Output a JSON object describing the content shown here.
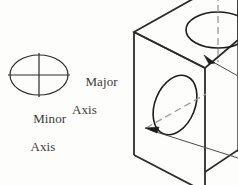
{
  "figure": {
    "background_color": "#fdfdfc",
    "line_color": "#2b2b2b",
    "centerline_color": "#8c8c8c",
    "text_color": "#3a3a3a"
  },
  "legend": {
    "ellipse": {
      "center_x": 39,
      "center_y": 75,
      "rx": 29,
      "ry": 20,
      "major_axis_label": "Major",
      "major_axis_label_line2": "Axis",
      "minor_axis_label": "Minor",
      "minor_axis_label_line2": "Axis"
    }
  },
  "labels": {
    "major": {
      "line1": "Major",
      "line2": "Axis"
    },
    "minor": {
      "line1": "Minor",
      "line2": "Axis"
    }
  },
  "solid": {
    "type": "isometric-box",
    "faces": [
      "top",
      "front-left",
      "right"
    ],
    "holes": [
      {
        "name": "top-face-hole",
        "shape": "ellipse",
        "center_x": 218,
        "center_y": 30,
        "rx": 32,
        "ry": 18,
        "rotation_deg": 0,
        "centerline": "vertical-dashed"
      },
      {
        "name": "front-face-hole",
        "shape": "ellipse",
        "center_x": 175,
        "center_y": 105,
        "rx": 20,
        "ry": 31,
        "rotation_deg": 22,
        "centerline": "diagonal-dashed"
      }
    ],
    "leaders": [
      {
        "name": "top-hole-leader",
        "arrow_x": 206,
        "arrow_y": 57,
        "direction": "up-left"
      },
      {
        "name": "front-hole-leader",
        "arrow_x": 147,
        "arrow_y": 129,
        "direction": "left"
      }
    ]
  },
  "geometry": {
    "box_vertices": {
      "top_left": [
        134,
        32
      ],
      "top_back": [
        212,
        -12
      ],
      "front_corner": [
        205,
        68
      ],
      "bottom_left": [
        134,
        155
      ],
      "bottom_front": [
        205,
        190
      ],
      "right_far": [
        238,
        48
      ]
    }
  }
}
